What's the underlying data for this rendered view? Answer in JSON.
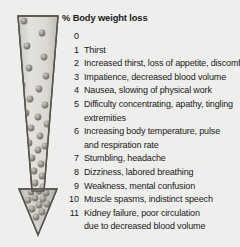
{
  "figure": {
    "title": "% Body weight loss",
    "arrow": {
      "icon": "down-arrow-water-loss",
      "description": "Tapering downward arrow filled with spheres representing progressive water loss",
      "fill_color": "#d6d5d0",
      "outline_color": "#57544c",
      "sphere_color": "#8d8b83"
    },
    "rows": [
      {
        "num": "0",
        "text": "",
        "cont": ""
      },
      {
        "num": "1",
        "text": "Thirst",
        "cont": ""
      },
      {
        "num": "2",
        "text": "Increased thirst, loss of appetite, discomfort",
        "cont": ""
      },
      {
        "num": "3",
        "text": "Impatience, decreased blood volume",
        "cont": ""
      },
      {
        "num": "4",
        "text": "Nausea, slowing of physical work",
        "cont": ""
      },
      {
        "num": "5",
        "text": "Difficulty concentrating, apathy, tingling",
        "cont": "extremities"
      },
      {
        "num": "6",
        "text": "Increasing body temperature, pulse",
        "cont": "and respiration rate"
      },
      {
        "num": "7",
        "text": "Stumbling, headache",
        "cont": ""
      },
      {
        "num": "8",
        "text": "Dizziness, labored breathing",
        "cont": ""
      },
      {
        "num": "9",
        "text": "Weakness, mental confusion",
        "cont": ""
      },
      {
        "num": "10",
        "text": "Muscle spasms, indistinct speech",
        "cont": ""
      },
      {
        "num": "11",
        "text": "Kidney failure, poor circulation",
        "cont": "due to decreased blood volume"
      }
    ]
  }
}
